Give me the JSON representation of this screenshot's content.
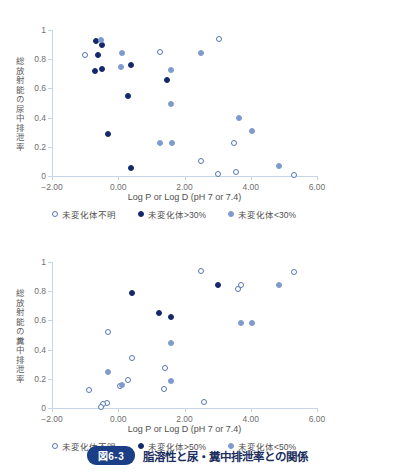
{
  "caption": {
    "badge": "図6-3",
    "text": "脂溶性と尿・糞中排泄率との関係"
  },
  "axis": {
    "xtitle": "Log P or Log D (pH 7 or 7.4)",
    "xticks": [
      "−2.00",
      "0.00",
      "2.00",
      "4.00",
      "6.00"
    ],
    "yticks": [
      "1",
      "0.8",
      "0.6",
      "0.4",
      "0.2",
      "0"
    ]
  },
  "panels": [
    {
      "id": "urine",
      "ylabel": "総放射能の尿中排泄率",
      "legend": [
        {
          "key": "unknown",
          "label": "未変化体不明"
        },
        {
          "key": "high",
          "label": "未変化体>30%"
        },
        {
          "key": "low",
          "label": "未変化体<30%"
        }
      ]
    },
    {
      "id": "feces",
      "ylabel": "総放射能の糞中排泄率",
      "legend": [
        {
          "key": "unknown",
          "label": "未変化体不明"
        },
        {
          "key": "high",
          "label": "未変化体>50%"
        },
        {
          "key": "low",
          "label": "未変化体<50%"
        }
      ]
    }
  ],
  "chart_data": [
    {
      "type": "scatter",
      "title": "総放射能の尿中排泄率 vs 脂溶性",
      "xlabel": "Log P or Log D (pH 7 or 7.4)",
      "ylabel": "総放射能の尿中排泄率",
      "xlim": [
        -2.0,
        6.0
      ],
      "ylim": [
        0,
        1
      ],
      "xticks": [
        -2.0,
        0.0,
        2.0,
        4.0,
        6.0
      ],
      "yticks": [
        0,
        0.2,
        0.4,
        0.6,
        0.8,
        1.0
      ],
      "grid": false,
      "legend_position": "below-axis",
      "series": [
        {
          "name": "未変化体不明",
          "marker": "open-circle",
          "color": "#5576ad",
          "points": [
            {
              "x": -1.0,
              "y": 0.83
            },
            {
              "x": 1.25,
              "y": 0.85
            },
            {
              "x": 3.05,
              "y": 0.94
            },
            {
              "x": 2.5,
              "y": 0.1
            },
            {
              "x": 3.0,
              "y": 0.015
            },
            {
              "x": 3.5,
              "y": 0.225
            },
            {
              "x": 3.55,
              "y": 0.03
            },
            {
              "x": 5.3,
              "y": 0.01
            }
          ]
        },
        {
          "name": "未変化体>30%",
          "marker": "filled-circle",
          "color": "#14296b",
          "points": [
            {
              "x": -0.68,
              "y": 0.925
            },
            {
              "x": -0.48,
              "y": 0.9
            },
            {
              "x": -0.6,
              "y": 0.83
            },
            {
              "x": -0.7,
              "y": 0.72
            },
            {
              "x": -0.5,
              "y": 0.73
            },
            {
              "x": 0.38,
              "y": 0.76
            },
            {
              "x": 1.48,
              "y": 0.66
            },
            {
              "x": 0.3,
              "y": 0.55
            },
            {
              "x": -0.32,
              "y": 0.29
            },
            {
              "x": 0.38,
              "y": 0.055
            }
          ]
        },
        {
          "name": "未変化体<30%",
          "marker": "filled-circle",
          "color": "#7e9bd0",
          "points": [
            {
              "x": -0.52,
              "y": 0.93
            },
            {
              "x": 0.1,
              "y": 0.845
            },
            {
              "x": 2.5,
              "y": 0.84
            },
            {
              "x": 0.08,
              "y": 0.75
            },
            {
              "x": 1.58,
              "y": 0.725
            },
            {
              "x": 1.6,
              "y": 0.49
            },
            {
              "x": 3.65,
              "y": 0.4
            },
            {
              "x": 4.05,
              "y": 0.305
            },
            {
              "x": 1.25,
              "y": 0.225
            },
            {
              "x": 1.62,
              "y": 0.225
            },
            {
              "x": 4.85,
              "y": 0.07
            }
          ]
        }
      ]
    },
    {
      "type": "scatter",
      "title": "総放射能の糞中排泄率 vs 脂溶性",
      "xlabel": "Log P or Log D (pH 7 or 7.4)",
      "ylabel": "総放射能の糞中排泄率",
      "xlim": [
        -2.0,
        6.0
      ],
      "ylim": [
        0,
        1
      ],
      "xticks": [
        -2.0,
        0.0,
        2.0,
        4.0,
        6.0
      ],
      "yticks": [
        0,
        0.2,
        0.4,
        0.6,
        0.8,
        1.0
      ],
      "grid": false,
      "legend_position": "below-axis",
      "series": [
        {
          "name": "未変化体不明",
          "marker": "open-circle",
          "color": "#5576ad",
          "points": [
            {
              "x": 2.5,
              "y": 0.935
            },
            {
              "x": 5.3,
              "y": 0.93
            },
            {
              "x": 3.6,
              "y": 0.815
            },
            {
              "x": 3.7,
              "y": 0.845
            },
            {
              "x": -0.32,
              "y": 0.52
            },
            {
              "x": 0.4,
              "y": 0.34
            },
            {
              "x": 1.42,
              "y": 0.275
            },
            {
              "x": 0.3,
              "y": 0.19
            },
            {
              "x": 0.05,
              "y": 0.15
            },
            {
              "x": 1.38,
              "y": 0.13
            },
            {
              "x": -0.88,
              "y": 0.12
            },
            {
              "x": -0.35,
              "y": 0.035
            },
            {
              "x": -0.45,
              "y": 0.025
            },
            {
              "x": -0.52,
              "y": 0.005
            },
            {
              "x": 2.6,
              "y": 0.04
            }
          ]
        },
        {
          "name": "未変化体>50%",
          "marker": "filled-circle",
          "color": "#14296b",
          "points": [
            {
              "x": 0.4,
              "y": 0.79
            },
            {
              "x": 3.0,
              "y": 0.84
            },
            {
              "x": 1.22,
              "y": 0.65
            },
            {
              "x": 1.6,
              "y": 0.625
            }
          ]
        },
        {
          "name": "未変化体<50%",
          "marker": "filled-circle",
          "color": "#7e9bd0",
          "points": [
            {
              "x": 4.85,
              "y": 0.845
            },
            {
              "x": 3.7,
              "y": 0.58
            },
            {
              "x": 4.05,
              "y": 0.585
            },
            {
              "x": 1.58,
              "y": 0.445
            },
            {
              "x": -0.32,
              "y": 0.245
            },
            {
              "x": 1.58,
              "y": 0.185
            },
            {
              "x": 0.1,
              "y": 0.155
            }
          ]
        }
      ]
    }
  ]
}
